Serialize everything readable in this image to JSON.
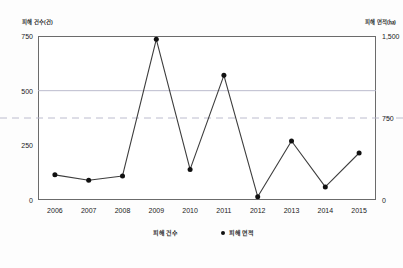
{
  "chart_data": {
    "type": "line",
    "title": "",
    "xlabel": "",
    "categories": [
      "2006",
      "2007",
      "2008",
      "2009",
      "2010",
      "2011",
      "2012",
      "2013",
      "2014",
      "2015"
    ],
    "series": [
      {
        "name": "피해 건수",
        "axis": "left",
        "unit": "건",
        "values": [
          115,
          90,
          110,
          735,
          140,
          570,
          15,
          270,
          60,
          215
        ]
      }
    ],
    "left_axis": {
      "label": "피해 건수(건)",
      "ticks": [
        "0",
        "250",
        "500",
        "750"
      ],
      "tick_values": [
        0,
        250,
        500,
        750
      ],
      "ylim": [
        0,
        750
      ]
    },
    "right_axis": {
      "label": "피해 면적(㏊)",
      "ticks": [
        "0",
        "750",
        "1,500"
      ],
      "tick_values": [
        0,
        750,
        1500
      ],
      "ylim": [
        0,
        1500
      ]
    },
    "legend": [
      {
        "label": "피해 건수",
        "marker": "line"
      },
      {
        "label": "피해 면적",
        "marker": "dot"
      }
    ],
    "legend_position": "bottom",
    "grid": {
      "solid_gridline_at": 500,
      "dashed_gridline_at": 750,
      "dashed_gridline_axis": "right"
    },
    "colors": {
      "line": "#3d3d3d",
      "marker": "#111111",
      "gridline": "#b4b4c8",
      "axis": "#6b6b6b",
      "background": "#ffffff"
    }
  }
}
